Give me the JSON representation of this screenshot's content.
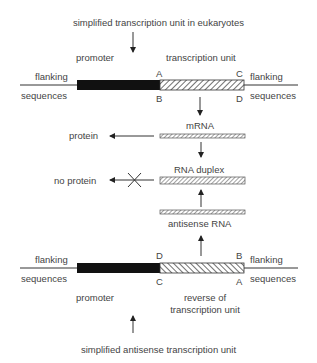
{
  "title_top": "simplified transcription unit in eukaryotes",
  "title_bottom": "simplified antisense transcription unit",
  "top_unit": {
    "flanking_left": [
      "flanking",
      "sequences"
    ],
    "flanking_right": [
      "flanking",
      "sequences"
    ],
    "promoter": "promoter",
    "region_label": "transcription unit",
    "corner_labels": {
      "top_left": "A",
      "bottom_left": "B",
      "top_right": "C",
      "bottom_right": "D"
    }
  },
  "middle": {
    "mrna": "mRNA",
    "protein": "protein",
    "duplex": "RNA duplex",
    "no_protein": "no protein",
    "antisense": "antisense RNA"
  },
  "bottom_unit": {
    "flanking_left": [
      "flanking",
      "sequences"
    ],
    "flanking_right": [
      "flanking",
      "sequences"
    ],
    "promoter": "promoter",
    "region_label_1": "reverse of",
    "region_label_2": "transcription unit",
    "corner_labels": {
      "top_left": "D",
      "bottom_left": "C",
      "top_right": "B",
      "bottom_right": "A"
    }
  }
}
